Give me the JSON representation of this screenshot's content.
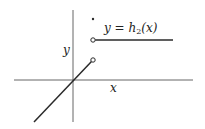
{
  "diagram": {
    "function_label": "y = h₂(x)",
    "function_label_parts": {
      "lhs": "y = h",
      "sub": "2",
      "rhs": "(x)"
    },
    "x_axis_label": "x",
    "y_axis_label": "y",
    "colors": {
      "line": "#2a2a2a",
      "axis": "#555555",
      "background": "#ffffff"
    },
    "elements": [
      {
        "type": "segment",
        "description": "line through origin with slope 1, ending at open circle"
      },
      {
        "type": "open-circle",
        "description": "endpoint of lower segment at x=a"
      },
      {
        "type": "open-circle",
        "description": "start of horizontal ray at x=a"
      },
      {
        "type": "filled-dot",
        "description": "function value at x=a"
      },
      {
        "type": "ray",
        "description": "horizontal line to the right"
      }
    ]
  }
}
